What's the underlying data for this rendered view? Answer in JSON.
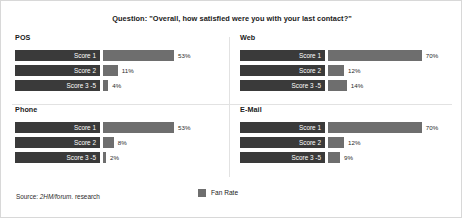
{
  "title": "Question: \"Overall, how satisfied were you with your last contact?\"",
  "legend": {
    "label": "Fan Rate",
    "swatch_color": "#6e6e6e"
  },
  "source": {
    "prefix": "Source: ",
    "emphasis": "2HM/forum.",
    "suffix": " research"
  },
  "colors": {
    "category_bar": "#3a3a3a",
    "value_bar": "#6e6e6e",
    "category_text": "#ffffff",
    "value_text": "#2b2b2b",
    "divider": "#e2e2e2",
    "frame": "#d8d8d8"
  },
  "chart_data": {
    "type": "bar",
    "title": "Question: \"Overall, how satisfied were you with your last contact?\"",
    "xlabel": "",
    "ylabel": "",
    "xlim": [
      0,
      100
    ],
    "grid": false,
    "legend_position": "bottom-center",
    "legend_entries": [
      "Fan Rate"
    ],
    "value_unit": "%",
    "categories": [
      "Score 1",
      "Score 2",
      "Score 3 -5"
    ],
    "panels": [
      {
        "name": "POS",
        "categories": [
          "Score 1",
          "Score 2",
          "Score 3 -5"
        ],
        "values": [
          53,
          11,
          4
        ],
        "value_labels": [
          "53%",
          "11%",
          "4%"
        ]
      },
      {
        "name": "Web",
        "categories": [
          "Score 1",
          "Score 2",
          "Score 3 -5"
        ],
        "values": [
          70,
          12,
          14
        ],
        "value_labels": [
          "70%",
          "12%",
          "14%"
        ]
      },
      {
        "name": "Phone",
        "categories": [
          "Score 1",
          "Score 2",
          "Score 3 -5"
        ],
        "values": [
          53,
          8,
          2
        ],
        "value_labels": [
          "53%",
          "8%",
          "2%"
        ]
      },
      {
        "name": "E-Mail",
        "categories": [
          "Score 1",
          "Score 2",
          "Score 3 -5"
        ],
        "values": [
          70,
          12,
          9
        ],
        "value_labels": [
          "70%",
          "12%",
          "9%"
        ]
      }
    ]
  }
}
